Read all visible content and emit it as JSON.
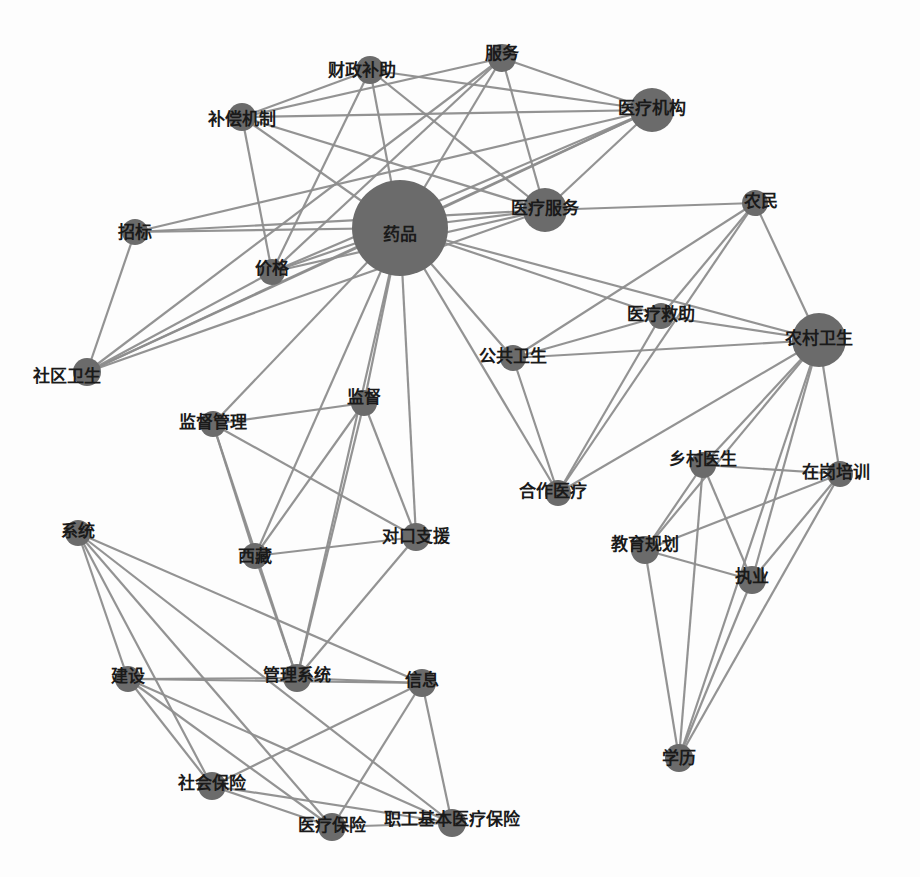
{
  "diagram": {
    "type": "keyword co-occurrence network",
    "colors": {
      "node": "#6b6b6b",
      "edge": "#8e8e8e",
      "label": "#1a1a1a",
      "background": "#fdfdfd"
    },
    "nodes": [
      {
        "id": "yaopin",
        "label": "药品",
        "x": 400,
        "y": 228,
        "r": 48,
        "lx": 0,
        "ly": 6
      },
      {
        "id": "yiliaofuwu",
        "label": "医疗服务",
        "x": 545,
        "y": 210,
        "r": 22,
        "lx": 0,
        "ly": -2
      },
      {
        "id": "yiliaojigou",
        "label": "医疗机构",
        "x": 652,
        "y": 110,
        "r": 22,
        "lx": 0,
        "ly": -2
      },
      {
        "id": "fuwu",
        "label": "服务",
        "x": 502,
        "y": 58,
        "r": 14,
        "lx": 0,
        "ly": -5
      },
      {
        "id": "caizhengbuzhu",
        "label": "财政补助",
        "x": 370,
        "y": 70,
        "r": 14,
        "lx": -8,
        "ly": 0
      },
      {
        "id": "buchangjizhi",
        "label": "补偿机制",
        "x": 242,
        "y": 117,
        "r": 14,
        "lx": 0,
        "ly": 2
      },
      {
        "id": "zhaobiao",
        "label": "招标",
        "x": 135,
        "y": 232,
        "r": 13,
        "lx": 0,
        "ly": 0
      },
      {
        "id": "jiage",
        "label": "价格",
        "x": 272,
        "y": 272,
        "r": 13,
        "lx": 0,
        "ly": -4
      },
      {
        "id": "shequweisheng",
        "label": "社区卫生",
        "x": 87,
        "y": 372,
        "r": 14,
        "lx": -20,
        "ly": 4
      },
      {
        "id": "nongmin",
        "label": "农民",
        "x": 755,
        "y": 203,
        "r": 13,
        "lx": 6,
        "ly": -2
      },
      {
        "id": "yiliaojiuzhu",
        "label": "医疗救助",
        "x": 661,
        "y": 316,
        "r": 13,
        "lx": 0,
        "ly": -2
      },
      {
        "id": "nongcunweisheng",
        "label": "农村卫生",
        "x": 819,
        "y": 340,
        "r": 27,
        "lx": 0,
        "ly": -2
      },
      {
        "id": "gonggongweisheng",
        "label": "公共卫生",
        "x": 513,
        "y": 358,
        "r": 13,
        "lx": 0,
        "ly": -2
      },
      {
        "id": "jiandu",
        "label": "监督",
        "x": 364,
        "y": 403,
        "r": 13,
        "lx": 0,
        "ly": -6
      },
      {
        "id": "jianduguanli",
        "label": "监督管理",
        "x": 213,
        "y": 424,
        "r": 13,
        "lx": 0,
        "ly": -2
      },
      {
        "id": "duikouzhiyuan",
        "label": "对口支援",
        "x": 416,
        "y": 537,
        "r": 14,
        "lx": 0,
        "ly": -1
      },
      {
        "id": "xizang",
        "label": "西藏",
        "x": 255,
        "y": 556,
        "r": 13,
        "lx": 0,
        "ly": 0
      },
      {
        "id": "hezuoyiliao",
        "label": "合作医疗",
        "x": 558,
        "y": 493,
        "r": 13,
        "lx": -5,
        "ly": -2
      },
      {
        "id": "xiangcunyisheng",
        "label": "乡村医生",
        "x": 703,
        "y": 465,
        "r": 13,
        "lx": 0,
        "ly": -6
      },
      {
        "id": "zaigangpeixun",
        "label": "在岗培训",
        "x": 840,
        "y": 474,
        "r": 13,
        "lx": -4,
        "ly": -2
      },
      {
        "id": "jiaoyuguihua",
        "label": "教育规划",
        "x": 645,
        "y": 550,
        "r": 14,
        "lx": 0,
        "ly": -6
      },
      {
        "id": "zhiye",
        "label": "执业",
        "x": 752,
        "y": 580,
        "r": 14,
        "lx": 0,
        "ly": -4
      },
      {
        "id": "xueli",
        "label": "学历",
        "x": 679,
        "y": 758,
        "r": 14,
        "lx": 0,
        "ly": 0
      },
      {
        "id": "xitong",
        "label": "系统",
        "x": 78,
        "y": 533,
        "r": 13,
        "lx": 0,
        "ly": -2
      },
      {
        "id": "jianshe",
        "label": "建设",
        "x": 128,
        "y": 679,
        "r": 13,
        "lx": 0,
        "ly": -3
      },
      {
        "id": "guanlixitong",
        "label": "管理系统",
        "x": 297,
        "y": 678,
        "r": 14,
        "lx": 0,
        "ly": -3
      },
      {
        "id": "xinxi",
        "label": "信息",
        "x": 422,
        "y": 683,
        "r": 14,
        "lx": 0,
        "ly": -3
      },
      {
        "id": "shehuibaoxian",
        "label": "社会保险",
        "x": 212,
        "y": 786,
        "r": 14,
        "lx": 0,
        "ly": -3
      },
      {
        "id": "yiliaobaoxian",
        "label": "医疗保险",
        "x": 332,
        "y": 827,
        "r": 14,
        "lx": 0,
        "ly": -2
      },
      {
        "id": "zhigongjibenyiliaobaoxian",
        "label": "职工基本医疗保险",
        "x": 452,
        "y": 823,
        "r": 14,
        "lx": 0,
        "ly": -4
      }
    ],
    "edges": [
      [
        "yaopin",
        "yiliaofuwu"
      ],
      [
        "yaopin",
        "yiliaojigou"
      ],
      [
        "yaopin",
        "fuwu"
      ],
      [
        "yaopin",
        "caizhengbuzhu"
      ],
      [
        "yaopin",
        "buchangjizhi"
      ],
      [
        "yaopin",
        "zhaobiao"
      ],
      [
        "yaopin",
        "jiage"
      ],
      [
        "yaopin",
        "shequweisheng"
      ],
      [
        "yaopin",
        "nongcunweisheng"
      ],
      [
        "yaopin",
        "yiliaojiuzhu"
      ],
      [
        "yaopin",
        "gonggongweisheng"
      ],
      [
        "yaopin",
        "hezuoyiliao"
      ],
      [
        "yaopin",
        "jiandu"
      ],
      [
        "yaopin",
        "jianduguanli"
      ],
      [
        "yaopin",
        "duikouzhiyuan"
      ],
      [
        "yaopin",
        "xizang"
      ],
      [
        "yaopin",
        "guanlixitong"
      ],
      [
        "yiliaofuwu",
        "yiliaojigou"
      ],
      [
        "yiliaofuwu",
        "fuwu"
      ],
      [
        "yiliaofuwu",
        "caizhengbuzhu"
      ],
      [
        "yiliaofuwu",
        "buchangjizhi"
      ],
      [
        "yiliaofuwu",
        "zhaobiao"
      ],
      [
        "yiliaofuwu",
        "jiage"
      ],
      [
        "yiliaofuwu",
        "shequweisheng"
      ],
      [
        "yiliaofuwu",
        "nongmin"
      ],
      [
        "yiliaojigou",
        "fuwu"
      ],
      [
        "yiliaojigou",
        "caizhengbuzhu"
      ],
      [
        "yiliaojigou",
        "buchangjizhi"
      ],
      [
        "yiliaojigou",
        "zhaobiao"
      ],
      [
        "yiliaojigou",
        "jiage"
      ],
      [
        "yiliaojigou",
        "shequweisheng"
      ],
      [
        "fuwu",
        "buchangjizhi"
      ],
      [
        "fuwu",
        "jiage"
      ],
      [
        "fuwu",
        "shequweisheng"
      ],
      [
        "caizhengbuzhu",
        "buchangjizhi"
      ],
      [
        "caizhengbuzhu",
        "jiage"
      ],
      [
        "buchangjizhi",
        "jiage"
      ],
      [
        "zhaobiao",
        "shequweisheng"
      ],
      [
        "jiage",
        "shequweisheng"
      ],
      [
        "nongmin",
        "nongcunweisheng"
      ],
      [
        "nongmin",
        "gonggongweisheng"
      ],
      [
        "nongmin",
        "hezuoyiliao"
      ],
      [
        "nongmin",
        "yiliaojiuzhu"
      ],
      [
        "yiliaojiuzhu",
        "nongcunweisheng"
      ],
      [
        "yiliaojiuzhu",
        "gonggongweisheng"
      ],
      [
        "yiliaojiuzhu",
        "hezuoyiliao"
      ],
      [
        "nongcunweisheng",
        "gonggongweisheng"
      ],
      [
        "nongcunweisheng",
        "hezuoyiliao"
      ],
      [
        "nongcunweisheng",
        "xiangcunyisheng"
      ],
      [
        "nongcunweisheng",
        "zaigangpeixun"
      ],
      [
        "nongcunweisheng",
        "jiaoyuguihua"
      ],
      [
        "nongcunweisheng",
        "zhiye"
      ],
      [
        "nongcunweisheng",
        "xueli"
      ],
      [
        "gonggongweisheng",
        "hezuoyiliao"
      ],
      [
        "xiangcunyisheng",
        "zaigangpeixun"
      ],
      [
        "xiangcunyisheng",
        "jiaoyuguihua"
      ],
      [
        "xiangcunyisheng",
        "zhiye"
      ],
      [
        "xiangcunyisheng",
        "xueli"
      ],
      [
        "zaigangpeixun",
        "jiaoyuguihua"
      ],
      [
        "zaigangpeixun",
        "zhiye"
      ],
      [
        "zaigangpeixun",
        "xueli"
      ],
      [
        "jiaoyuguihua",
        "zhiye"
      ],
      [
        "jiaoyuguihua",
        "xueli"
      ],
      [
        "zhiye",
        "xueli"
      ],
      [
        "jiandu",
        "jianduguanli"
      ],
      [
        "jiandu",
        "duikouzhiyuan"
      ],
      [
        "jiandu",
        "xizang"
      ],
      [
        "jiandu",
        "guanlixitong"
      ],
      [
        "jianduguanli",
        "duikouzhiyuan"
      ],
      [
        "jianduguanli",
        "xizang"
      ],
      [
        "jianduguanli",
        "guanlixitong"
      ],
      [
        "duikouzhiyuan",
        "xizang"
      ],
      [
        "duikouzhiyuan",
        "guanlixitong"
      ],
      [
        "xizang",
        "guanlixitong"
      ],
      [
        "xitong",
        "jianshe"
      ],
      [
        "xitong",
        "xinxi"
      ],
      [
        "xitong",
        "shehuibaoxian"
      ],
      [
        "xitong",
        "yiliaobaoxian"
      ],
      [
        "xitong",
        "zhigongjibenyiliaobaoxian"
      ],
      [
        "jianshe",
        "guanlixitong"
      ],
      [
        "jianshe",
        "xinxi"
      ],
      [
        "jianshe",
        "shehuibaoxian"
      ],
      [
        "jianshe",
        "yiliaobaoxian"
      ],
      [
        "jianshe",
        "zhigongjibenyiliaobaoxian"
      ],
      [
        "guanlixitong",
        "xinxi"
      ],
      [
        "xinxi",
        "shehuibaoxian"
      ],
      [
        "xinxi",
        "yiliaobaoxian"
      ],
      [
        "xinxi",
        "zhigongjibenyiliaobaoxian"
      ],
      [
        "shehuibaoxian",
        "yiliaobaoxian"
      ],
      [
        "shehuibaoxian",
        "zhigongjibenyiliaobaoxian"
      ],
      [
        "yiliaobaoxian",
        "zhigongjibenyiliaobaoxian"
      ]
    ]
  }
}
